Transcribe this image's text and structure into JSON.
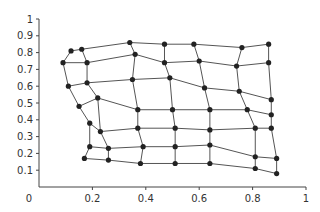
{
  "chart_data": {
    "type": "scatter",
    "subtype": "warped-grid-mesh",
    "title": "",
    "xlabel": "",
    "ylabel": "",
    "xlim": [
      0,
      1
    ],
    "ylim": [
      0,
      1
    ],
    "grid": false,
    "legend": null,
    "x_ticks": [
      "0",
      "0.2",
      "0.4",
      "0.6",
      "0.8",
      "1"
    ],
    "y_ticks": [
      "0.1",
      "0.2",
      "0.3",
      "0.4",
      "0.5",
      "0.6",
      "0.7",
      "0.8",
      "0.9",
      "1"
    ],
    "colors": {
      "line": "#555555",
      "point": "#222222",
      "axis": "#444444"
    },
    "rows": 7,
    "cols": 7,
    "grid_points": [
      [
        [
          0.12,
          0.81
        ],
        [
          0.16,
          0.82
        ],
        [
          0.34,
          0.86
        ],
        [
          0.47,
          0.85
        ],
        [
          0.58,
          0.85
        ],
        [
          0.76,
          0.83
        ],
        [
          0.86,
          0.85
        ]
      ],
      [
        [
          0.09,
          0.74
        ],
        [
          0.18,
          0.74
        ],
        [
          0.36,
          0.79
        ],
        [
          0.47,
          0.74
        ],
        [
          0.6,
          0.75
        ],
        [
          0.74,
          0.72
        ],
        [
          0.86,
          0.74
        ]
      ],
      [
        [
          0.11,
          0.6
        ],
        [
          0.18,
          0.62
        ],
        [
          0.35,
          0.64
        ],
        [
          0.49,
          0.65
        ],
        [
          0.62,
          0.59
        ],
        [
          0.75,
          0.57
        ],
        [
          0.87,
          0.52
        ]
      ],
      [
        [
          0.15,
          0.48
        ],
        [
          0.22,
          0.53
        ],
        [
          0.37,
          0.46
        ],
        [
          0.5,
          0.46
        ],
        [
          0.64,
          0.46
        ],
        [
          0.78,
          0.46
        ],
        [
          0.87,
          0.43
        ]
      ],
      [
        [
          0.19,
          0.38
        ],
        [
          0.23,
          0.33
        ],
        [
          0.37,
          0.35
        ],
        [
          0.51,
          0.35
        ],
        [
          0.64,
          0.34
        ],
        [
          0.81,
          0.35
        ],
        [
          0.87,
          0.35
        ]
      ],
      [
        [
          0.19,
          0.24
        ],
        [
          0.26,
          0.23
        ],
        [
          0.39,
          0.24
        ],
        [
          0.51,
          0.24
        ],
        [
          0.64,
          0.25
        ],
        [
          0.81,
          0.18
        ],
        [
          0.89,
          0.17
        ]
      ],
      [
        [
          0.17,
          0.17
        ],
        [
          0.26,
          0.16
        ],
        [
          0.38,
          0.14
        ],
        [
          0.51,
          0.14
        ],
        [
          0.64,
          0.14
        ],
        [
          0.81,
          0.11
        ],
        [
          0.89,
          0.08
        ]
      ]
    ]
  }
}
